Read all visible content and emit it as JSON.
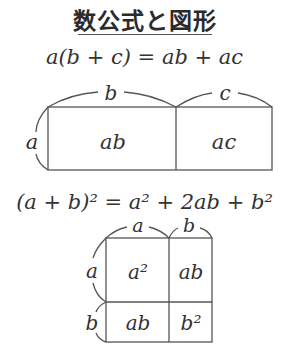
{
  "title": "数公式と図形",
  "formulas": {
    "distributive": "a(b + c) = ab + ac",
    "square_of_sum": "(a + b)² = a² + 2ab + b²"
  },
  "diagram1": {
    "side_left": "a",
    "top_b": "b",
    "top_c": "c",
    "cell_left": "ab",
    "cell_right": "ac"
  },
  "diagram2": {
    "top_a": "a",
    "top_b": "b",
    "side_a": "a",
    "side_b": "b",
    "cells": [
      "a²",
      "ab",
      "ab",
      "b²"
    ]
  },
  "colors": {
    "line": "#555555",
    "text": "#333333"
  }
}
